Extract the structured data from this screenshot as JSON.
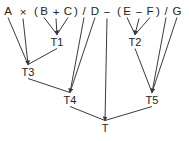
{
  "diagram": {
    "type": "expression-dag",
    "expression": "A × (B + C) / D − (E − F) / G",
    "stroke_color": "#3a3a3a",
    "text_color": "#242424",
    "background_color": "#ffffff",
    "tokens": [
      {
        "id": "tok-A",
        "label": "A",
        "x": 8,
        "y": 11
      },
      {
        "id": "tok-times",
        "label": "×",
        "x": 23,
        "y": 12
      },
      {
        "id": "tok-lparen",
        "label": "(",
        "x": 36,
        "y": 11
      },
      {
        "id": "tok-B",
        "label": "B",
        "x": 44,
        "y": 11
      },
      {
        "id": "tok-plus",
        "label": "+",
        "x": 56,
        "y": 12
      },
      {
        "id": "tok-C",
        "label": "C",
        "x": 68,
        "y": 11
      },
      {
        "id": "tok-rparen",
        "label": ")",
        "x": 76,
        "y": 11
      },
      {
        "id": "tok-div1",
        "label": "/",
        "x": 84,
        "y": 11
      },
      {
        "id": "tok-D",
        "label": "D",
        "x": 95,
        "y": 11
      },
      {
        "id": "tok-minus1",
        "label": "−",
        "x": 107,
        "y": 12
      },
      {
        "id": "tok-lparen2",
        "label": "(",
        "x": 119,
        "y": 11
      },
      {
        "id": "tok-E",
        "label": "E",
        "x": 127,
        "y": 11
      },
      {
        "id": "tok-minus2",
        "label": "−",
        "x": 139,
        "y": 12
      },
      {
        "id": "tok-F",
        "label": "F",
        "x": 150,
        "y": 11
      },
      {
        "id": "tok-rparen2",
        "label": ")",
        "x": 158,
        "y": 11
      },
      {
        "id": "tok-div2",
        "label": "/",
        "x": 166,
        "y": 11
      },
      {
        "id": "tok-G",
        "label": "G",
        "x": 177,
        "y": 11
      }
    ],
    "nodes": [
      {
        "id": "T1",
        "label": "T1",
        "x": 57,
        "y": 42,
        "expression": "B + C"
      },
      {
        "id": "T2",
        "label": "T2",
        "x": 135,
        "y": 42,
        "expression": "E − F"
      },
      {
        "id": "T3",
        "label": "T3",
        "x": 28,
        "y": 72,
        "expression": "A × T1"
      },
      {
        "id": "T4",
        "label": "T4",
        "x": 70,
        "y": 100,
        "expression": "T3 / D"
      },
      {
        "id": "T5",
        "label": "T5",
        "x": 152,
        "y": 100,
        "expression": "T2 / G"
      },
      {
        "id": "T",
        "label": "T",
        "x": 105,
        "y": 128,
        "expression": "T4 − T5"
      }
    ],
    "edges": [
      {
        "from": "tok-B",
        "to": "T1",
        "arrow": false
      },
      {
        "from": "tok-plus",
        "to": "T1",
        "arrow": true
      },
      {
        "from": "tok-C",
        "to": "T1",
        "arrow": false
      },
      {
        "from": "tok-E",
        "to": "T2",
        "arrow": false
      },
      {
        "from": "tok-minus2",
        "to": "T2",
        "arrow": true
      },
      {
        "from": "tok-F",
        "to": "T2",
        "arrow": false
      },
      {
        "from": "tok-A",
        "to": "T3",
        "arrow": false
      },
      {
        "from": "tok-times",
        "to": "T3",
        "arrow": true
      },
      {
        "from": "T1",
        "to": "T3",
        "arrow": false
      },
      {
        "from": "tok-div1",
        "to": "T4",
        "arrow": true
      },
      {
        "from": "tok-D",
        "to": "T4",
        "arrow": false
      },
      {
        "from": "T3",
        "to": "T4",
        "arrow": false
      },
      {
        "from": "T2",
        "to": "T5",
        "arrow": false
      },
      {
        "from": "tok-div2",
        "to": "T5",
        "arrow": true
      },
      {
        "from": "tok-G",
        "to": "T5",
        "arrow": false
      },
      {
        "from": "T4",
        "to": "T",
        "arrow": false
      },
      {
        "from": "tok-minus1",
        "to": "T",
        "arrow": true
      },
      {
        "from": "T5",
        "to": "T",
        "arrow": false
      }
    ]
  }
}
